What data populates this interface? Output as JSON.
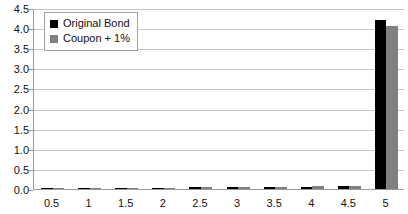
{
  "chart_data": {
    "type": "bar",
    "title": "",
    "xlabel": "",
    "ylabel": "",
    "categories": [
      "0.5",
      "1",
      "1.5",
      "2",
      "2.5",
      "3",
      "3.5",
      "4",
      "4.5",
      "5"
    ],
    "series": [
      {
        "name": "Original Bond",
        "color": "#000000",
        "values": [
          0.005,
          0.01,
          0.02,
          0.03,
          0.04,
          0.05,
          0.055,
          0.06,
          0.07,
          4.2
        ]
      },
      {
        "name": "Coupon + 1%",
        "color": "#808080",
        "values": [
          0.005,
          0.01,
          0.02,
          0.03,
          0.04,
          0.05,
          0.055,
          0.065,
          0.075,
          4.05
        ]
      }
    ],
    "ylim": [
      0.0,
      4.5
    ],
    "ytick_labels": [
      "0.0",
      "0.5",
      "1.0",
      "1.5",
      "2.0",
      "2.5",
      "3.0",
      "3.5",
      "4.0",
      "4.5"
    ],
    "ytick_values": [
      0.0,
      0.5,
      1.0,
      1.5,
      2.0,
      2.5,
      3.0,
      3.5,
      4.0,
      4.5
    ],
    "grid": true,
    "legend_position": "top-left",
    "plot_background": "#ffffff",
    "gridline_color": "#c8c8c8",
    "axis_color": "#9a9a9a",
    "text_color": "#111111"
  },
  "legend": {
    "entries": [
      {
        "label": "Original Bond",
        "color": "#000000"
      },
      {
        "label": "Coupon + 1%",
        "color": "#808080"
      }
    ]
  }
}
